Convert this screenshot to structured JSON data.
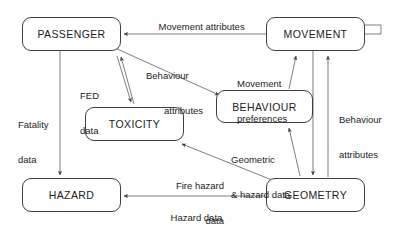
{
  "diagram": {
    "type": "flow-diagram",
    "background_color": "#ffffff",
    "line_color": "#4a4a4a",
    "text_color": "#1c1c1c",
    "nodes": [
      {
        "id": "passenger",
        "label": "PASSENGER",
        "x": 22,
        "y": 17,
        "w": 99,
        "h": 34
      },
      {
        "id": "movement",
        "label": "MOVEMENT",
        "x": 266,
        "y": 17,
        "w": 99,
        "h": 34
      },
      {
        "id": "toxicity",
        "label": "TOXICITY",
        "x": 85,
        "y": 107,
        "w": 99,
        "h": 34
      },
      {
        "id": "behaviour",
        "label": "BEHAVIOUR",
        "x": 216,
        "y": 90,
        "w": 97,
        "h": 33
      },
      {
        "id": "hazard",
        "label": "HAZARD",
        "x": 22,
        "y": 178,
        "w": 99,
        "h": 34
      },
      {
        "id": "geometry",
        "label": "GEOMETRY",
        "x": 266,
        "y": 178,
        "w": 99,
        "h": 34
      }
    ],
    "edges": [
      {
        "id": "movement-to-passenger",
        "from": "movement",
        "to": "passenger",
        "label": "Movement attributes"
      },
      {
        "id": "passenger-to-behaviour",
        "from": "passenger",
        "to": "behaviour",
        "label": "Behaviour\n      attributes"
      },
      {
        "id": "behaviour-to-movement",
        "from": "behaviour",
        "to": "movement",
        "label": "Movement\npreferences"
      },
      {
        "id": "geometry-to-movement",
        "from": "geometry",
        "to": "movement",
        "label": "Behaviour\nattributes"
      },
      {
        "id": "toxicity-to-passenger",
        "from": "toxicity",
        "to": "passenger",
        "label": "FED\ndata"
      },
      {
        "id": "passenger-to-toxicity",
        "from": "passenger",
        "to": "toxicity",
        "label": "FED\ndata"
      },
      {
        "id": "passenger-to-hazard",
        "from": "passenger",
        "to": "hazard",
        "label": "Fatality\ndata"
      },
      {
        "id": "geometry-to-toxicity",
        "from": "geometry",
        "to": "toxicity",
        "label": "Fire hazard\n        data"
      },
      {
        "id": "geometry-to-behaviour",
        "from": "geometry",
        "to": "behaviour",
        "label": "Geometric\n& hazard data"
      },
      {
        "id": "geometry-to-hazard",
        "from": "geometry",
        "to": "hazard",
        "label": "Hazard data"
      }
    ],
    "labels": {
      "movement_attributes": "Movement attributes",
      "behaviour_attributes_left_1": "Behaviour",
      "behaviour_attributes_left_2": "attributes",
      "movement_preferences_1": "Movement",
      "movement_preferences_2": "preferences",
      "behaviour_attributes_right_1": "Behaviour",
      "behaviour_attributes_right_2": "attributes",
      "fed_data_1": "FED",
      "fed_data_2": "data",
      "fatality_data_1": "Fatality",
      "fatality_data_2": "data",
      "geometric_hazard_data_1": "Geometric",
      "geometric_hazard_data_2": "& hazard data",
      "fire_hazard_data_1": "Fire hazard",
      "fire_hazard_data_2": "data",
      "hazard_data": "Hazard data"
    }
  }
}
